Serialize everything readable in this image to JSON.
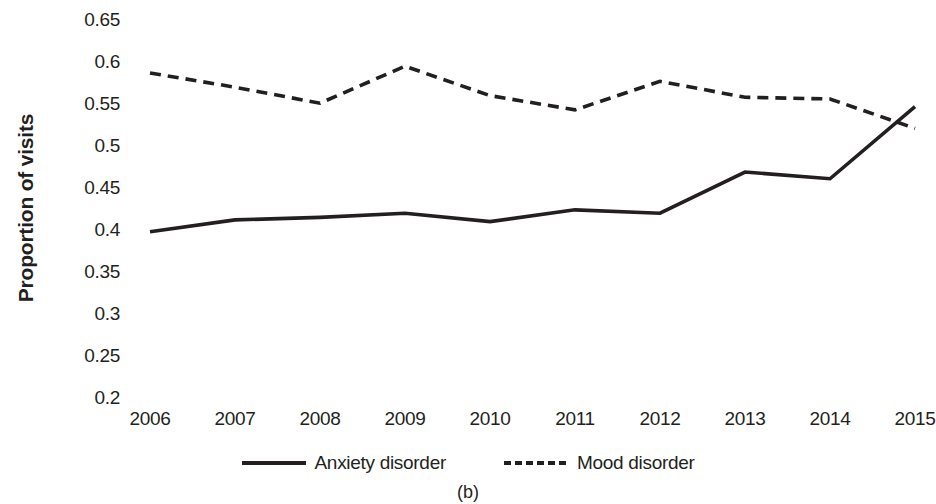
{
  "chart_data": {
    "type": "line",
    "title": "",
    "caption": "(b)",
    "xlabel": "",
    "ylabel": "Proportion of visits",
    "x": [
      2006,
      2007,
      2008,
      2009,
      2010,
      2011,
      2012,
      2013,
      2014,
      2015
    ],
    "xtick_labels": [
      "2006",
      "2007",
      "2008",
      "2009",
      "2010",
      "2011",
      "2012",
      "2013",
      "2014",
      "2015"
    ],
    "ytick_labels": [
      "0.65",
      "0.6",
      "0.55",
      "0.5",
      "0.45",
      "0.4",
      "0.35",
      "0.3",
      "0.25",
      "0.2"
    ],
    "ytick_values": [
      0.65,
      0.6,
      0.55,
      0.5,
      0.45,
      0.4,
      0.35,
      0.3,
      0.25,
      0.2
    ],
    "ylim": [
      0.2,
      0.65
    ],
    "xlim": [
      2006,
      2015
    ],
    "grid": false,
    "legend_position": "bottom",
    "series": [
      {
        "name": "Anxiety disorder",
        "style": "solid",
        "color": "#231f20",
        "values": [
          0.398,
          0.412,
          0.415,
          0.42,
          0.41,
          0.424,
          0.42,
          0.469,
          0.461,
          0.547
        ]
      },
      {
        "name": "Mood disorder",
        "style": "dashed",
        "color": "#231f20",
        "values": [
          0.587,
          0.57,
          0.551,
          0.595,
          0.56,
          0.543,
          0.577,
          0.558,
          0.556,
          0.521
        ]
      }
    ]
  }
}
